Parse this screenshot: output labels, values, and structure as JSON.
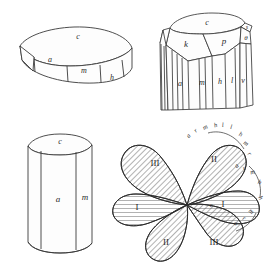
{
  "plate": {
    "title": "Crystal figure plate",
    "background_color": "#ffffff",
    "ink_color": "#2b2b2b",
    "figure_count": 4
  },
  "figures": [
    {
      "id": "fig-tabular-band",
      "name": "tabular-hexagonal-crystal",
      "position": "top-left",
      "face_labels": [
        {
          "letter": "c",
          "x": 78,
          "y": 39
        },
        {
          "letter": "a",
          "x": 50,
          "y": 62
        },
        {
          "letter": "m",
          "x": 84,
          "y": 71
        },
        {
          "letter": "h",
          "x": 112,
          "y": 84
        }
      ]
    },
    {
      "id": "fig-prism-terminated",
      "name": "terminated-prism-crystal",
      "position": "top-right",
      "face_labels": [
        {
          "letter": "c",
          "x": 207,
          "y": 22
        },
        {
          "letter": "k",
          "x": 186,
          "y": 43
        },
        {
          "letter": "p",
          "x": 224,
          "y": 41
        },
        {
          "letter": "s",
          "x": 247,
          "y": 26
        },
        {
          "letter": "θ",
          "x": 251,
          "y": 38
        },
        {
          "letter": "a",
          "x": 185,
          "y": 83
        },
        {
          "letter": "m",
          "x": 212,
          "y": 81
        },
        {
          "letter": "h",
          "x": 229,
          "y": 79
        },
        {
          "letter": "l",
          "x": 242,
          "y": 78
        },
        {
          "letter": "v",
          "x": 252,
          "y": 78
        }
      ]
    },
    {
      "id": "fig-simple-prism",
      "name": "simple-hexagonal-prism",
      "position": "bottom-left",
      "face_labels": [
        {
          "letter": "c",
          "x": 66,
          "y": 140
        },
        {
          "letter": "a",
          "x": 56,
          "y": 199
        },
        {
          "letter": "m",
          "x": 88,
          "y": 197
        }
      ]
    },
    {
      "id": "fig-rosette-twin",
      "name": "six-lobed-twin-rosette",
      "position": "bottom-right",
      "sector_numerals": [
        {
          "numeral": "III",
          "x": 172,
          "y": 163
        },
        {
          "numeral": "II",
          "x": 212,
          "y": 159
        },
        {
          "numeral": "I",
          "x": 152,
          "y": 205
        },
        {
          "numeral": "I",
          "x": 222,
          "y": 203
        },
        {
          "numeral": "II",
          "x": 176,
          "y": 239
        },
        {
          "numeral": "III",
          "x": 216,
          "y": 241
        }
      ],
      "center_label": {
        "letter": "c",
        "x": 212,
        "y": 203
      },
      "edge_letters": [
        {
          "letter": "a",
          "x": 190,
          "y": 137,
          "rot": -52
        },
        {
          "letter": "r",
          "x": 197,
          "y": 132,
          "rot": -42
        },
        {
          "letter": "m",
          "x": 206,
          "y": 129,
          "rot": -28
        },
        {
          "letter": "h",
          "x": 216,
          "y": 127,
          "rot": -14
        },
        {
          "letter": "l",
          "x": 223,
          "y": 127,
          "rot": -4
        },
        {
          "letter": "l",
          "x": 230,
          "y": 129,
          "rot": 8
        },
        {
          "letter": "h",
          "x": 239,
          "y": 135,
          "rot": 22
        },
        {
          "letter": "m",
          "x": 244,
          "y": 144,
          "rot": 36
        },
        {
          "letter": "r",
          "x": 247,
          "y": 154,
          "rot": 52
        },
        {
          "letter": "a",
          "x": 238,
          "y": 167,
          "rot": -44
        },
        {
          "letter": "r",
          "x": 245,
          "y": 170,
          "rot": -28
        },
        {
          "letter": "m",
          "x": 253,
          "y": 174,
          "rot": -14
        },
        {
          "letter": "h",
          "x": 258,
          "y": 184,
          "rot": 20
        },
        {
          "letter": "h",
          "x": 258,
          "y": 198,
          "rot": 58
        },
        {
          "letter": "m",
          "x": 250,
          "y": 212,
          "rot": 44
        },
        {
          "letter": "r",
          "x": 243,
          "y": 219,
          "rot": 32
        },
        {
          "letter": "a",
          "x": 235,
          "y": 224,
          "rot": 22
        }
      ]
    }
  ]
}
